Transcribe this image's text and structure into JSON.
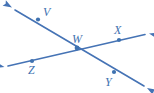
{
  "figure": {
    "width": 154,
    "height": 93,
    "background_color": "#ffffff",
    "stroke_color": "#4573b5",
    "label_color": "#3f72b0",
    "point_color": "#3f72b0",
    "stroke_width": 1.6,
    "point_radius": 2.1
  },
  "labels": {
    "v": "V",
    "w": "W",
    "x": "X",
    "y": "Y",
    "z": "Z"
  },
  "label_positions": {
    "v": {
      "x": 43,
      "y": 16
    },
    "w": {
      "x": 72,
      "y": 43
    },
    "x": {
      "x": 114,
      "y": 34
    },
    "y": {
      "x": 105,
      "y": 86
    },
    "z": {
      "x": 28,
      "y": 74
    }
  },
  "points": [
    {
      "name": "V",
      "x": 38,
      "y": 19.5
    },
    {
      "name": "W",
      "x": 77,
      "y": 48
    },
    {
      "name": "X",
      "x": 119,
      "y": 40
    },
    {
      "name": "Y",
      "x": 114,
      "y": 72
    },
    {
      "name": "Z",
      "x": 32,
      "y": 61
    }
  ],
  "lines": [
    {
      "name": "line-v-w-y",
      "through": [
        "V",
        "W",
        "Y"
      ],
      "start": {
        "x": 15,
        "y": 10
      },
      "end": {
        "x": 144,
        "y": 86
      },
      "arrow_start": true,
      "arrow_end": true
    },
    {
      "name": "line-z-w-x",
      "through": [
        "Z",
        "W",
        "X"
      ],
      "start": {
        "x": 8,
        "y": 66
      },
      "end": {
        "x": 145,
        "y": 34.5
      },
      "arrow_start": true,
      "arrow_end": true
    }
  ],
  "arrowheads": [
    {
      "name": "arrow-top-left",
      "tip_x": 12,
      "tip_y": 7.5,
      "angle_deg": 210.5
    },
    {
      "name": "arrow-bottom-right",
      "tip_x": 147,
      "tip_y": 88,
      "angle_deg": 30.5
    },
    {
      "name": "arrow-left",
      "tip_x": 4.5,
      "tip_y": 67,
      "angle_deg": 193
    },
    {
      "name": "arrow-right",
      "tip_x": 149,
      "tip_y": 33.5,
      "angle_deg": 13
    }
  ]
}
